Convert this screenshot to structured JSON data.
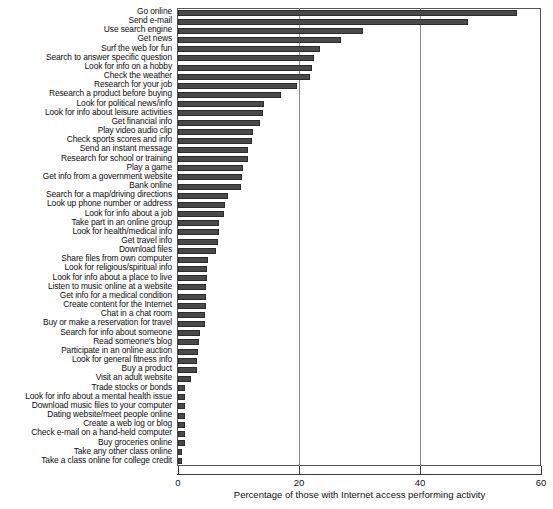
{
  "chart_data": {
    "type": "bar",
    "orientation": "horizontal",
    "title": "",
    "xlabel": "Percentage of those with Internet access performing activity",
    "ylabel": "",
    "xlim": [
      0,
      60
    ],
    "xticks": [
      0,
      20,
      40,
      60
    ],
    "xtick_labels": [
      "0",
      "20",
      "40",
      "60"
    ],
    "grid": true,
    "grid_axis": "x",
    "legend": false,
    "bar_color": "#4a4a4a",
    "categories": [
      "Go online",
      "Send e-mail",
      "Use search engine",
      "Get news",
      "Surf the web for fun",
      "Search to answer specific question",
      "Look for info on a hobby",
      "Check the weather",
      "Research for your job",
      "Research a product before buying",
      "Look for political news/info",
      "Look for info about leisure activities",
      "Get financial info",
      "Play video audio clip",
      "Check sports scores and info",
      "Send an instant message",
      "Research for school or training",
      "Play a game",
      "Get info from a government website",
      "Bank online",
      "Search for a map/driving directions",
      "Look up phone number or address",
      "Look for info about a job",
      "Take part in an online group",
      "Look for health/medical info",
      "Get travel info",
      "Download files",
      "Share files from own computer",
      "Look for religious/spiritual info",
      "Look for info about a place to live",
      "Listen to music online at a website",
      "Get info for a  medical condition",
      "Create content for the Internet",
      "Chat in a chat room",
      "Buy or make a reservation for travel",
      "Search for info about someone",
      "Read someone's blog",
      "Participate in an online auction",
      "Look for general fitness info",
      "Buy a product",
      "Visit an adult website",
      "Trade stocks or bonds",
      "Look for info about a mental health issue",
      "Download music files to your computer",
      "Dating website/meet people online",
      "Create a web log or blog",
      "Check e-mail on a hand-held computer",
      "Buy groceries online",
      "Take any other class online",
      "Take a class online for college credit"
    ],
    "values": [
      56.0,
      48.0,
      30.5,
      27.0,
      23.5,
      22.5,
      22.2,
      21.8,
      19.6,
      17.0,
      14.2,
      14.0,
      13.5,
      12.4,
      12.3,
      11.5,
      11.5,
      10.8,
      10.6,
      10.4,
      8.3,
      7.7,
      7.6,
      6.8,
      6.8,
      6.6,
      6.3,
      4.9,
      4.8,
      4.8,
      4.6,
      4.6,
      4.6,
      4.5,
      4.4,
      3.6,
      3.4,
      3.3,
      3.2,
      3.2,
      2.2,
      1.2,
      1.2,
      1.2,
      1.1,
      1.1,
      1.1,
      1.1,
      0.7,
      0.6
    ]
  }
}
